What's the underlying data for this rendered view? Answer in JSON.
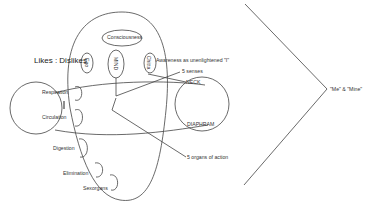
{
  "diagram": {
    "labels": {
      "consciousness": "Consciousness",
      "ego": "Ego",
      "mind": "MIND",
      "chitta": "Chitta",
      "likes_dislikes": "Likes : Dislikes",
      "awareness": "Awareness as unenlightened \"I\"",
      "five_senses": "5 senses",
      "neck": "NECK",
      "diaphragm": "DIAPHRAM",
      "five_organs": "5 organs of action",
      "respiration": "Respiration",
      "circulation": "Circulation",
      "digestion": "Digestion",
      "elimination": "Elimination",
      "sexorgans": "Sexorgans",
      "me_mine": "\"Me\" & \"Mine\""
    },
    "colors": {
      "stroke": "#444444",
      "text": "#333333",
      "background": "#ffffff"
    }
  }
}
